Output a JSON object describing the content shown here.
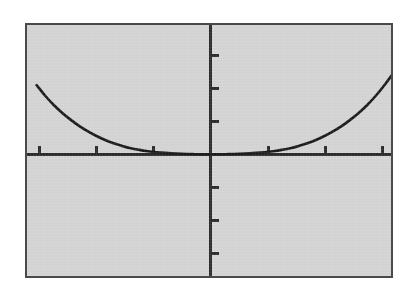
{
  "figure": {
    "background_color": "#ffffff",
    "plot_background_color": "#d4d4d4",
    "frame_border_color": "#4a4a4a",
    "axis_color": "#2b2b2b",
    "curve_color": "#1a1a1a",
    "title": "",
    "caption": ""
  },
  "chart_data": {
    "type": "line",
    "title": "",
    "xlabel": "",
    "ylabel": "",
    "xlim": [
      -3.05,
      3.2
    ],
    "ylim": [
      -4.0,
      4.0
    ],
    "grid": false,
    "legend": null,
    "axes": {
      "x_axis_visible": true,
      "y_axis_visible": true,
      "origin_pixel": [
        210,
        154
      ],
      "x_ticks": [
        -3,
        -2,
        -1,
        1,
        2,
        3
      ],
      "y_ticks": [
        -3,
        -2,
        -1,
        1,
        2,
        3
      ],
      "x_tick_labels": [
        "",
        "",
        "",
        "",
        "",
        ""
      ],
      "y_tick_labels": [
        "",
        "",
        "",
        "",
        "",
        ""
      ],
      "x_tick_spacing_px": 57,
      "y_tick_spacing_px": 33,
      "tick_length_px": 9
    },
    "series": [
      {
        "name": "y = f(x)",
        "description": "symmetric U-shaped exponential-type curve, flat near zero, rising steeply at both edges",
        "x": [
          -3.05,
          -2.9,
          -2.75,
          -2.6,
          -2.45,
          -2.3,
          -2.15,
          -2.0,
          -1.85,
          -1.7,
          -1.55,
          -1.4,
          -1.25,
          -1.1,
          -0.95,
          -0.8,
          -0.6,
          -0.3,
          0.0,
          0.3,
          0.6,
          0.8,
          0.95,
          1.1,
          1.25,
          1.4,
          1.55,
          1.7,
          1.85,
          2.0,
          2.15,
          2.3,
          2.45,
          2.6,
          2.75,
          2.9,
          3.05,
          3.2
        ],
        "y": [
          2.1,
          1.78,
          1.5,
          1.26,
          1.05,
          0.86,
          0.7,
          0.56,
          0.44,
          0.34,
          0.26,
          0.19,
          0.14,
          0.1,
          0.07,
          0.05,
          0.03,
          0.01,
          0.0,
          0.01,
          0.03,
          0.05,
          0.07,
          0.1,
          0.14,
          0.19,
          0.26,
          0.34,
          0.44,
          0.56,
          0.7,
          0.86,
          1.05,
          1.26,
          1.5,
          1.78,
          2.1,
          2.45
        ]
      }
    ]
  },
  "geometry": {
    "frame": {
      "left": 25,
      "top": 23,
      "width": 368,
      "height": 255
    },
    "curve_left_start_pixel": [
      26,
      85
    ],
    "curve_right_end_pixel": [
      392,
      85
    ],
    "curve_flat_region_pixels": [
      68,
      352
    ]
  }
}
